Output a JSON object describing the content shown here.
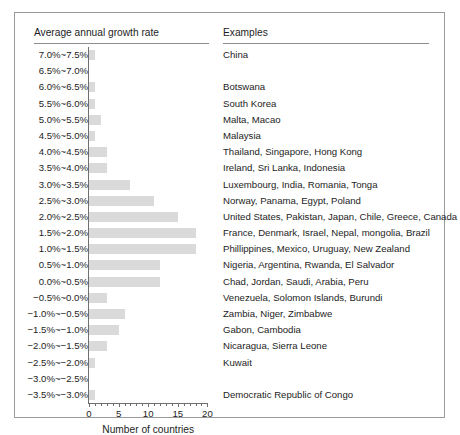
{
  "figure": {
    "left_column_header": "Average annual growth rate",
    "right_column_header": "Examples"
  },
  "chart_data": {
    "type": "bar",
    "orientation": "horizontal",
    "title": "",
    "xlabel": "Number of countries",
    "ylabel": "Average annual growth rate",
    "xlim": [
      0,
      20
    ],
    "xticks": [
      0,
      5,
      10,
      15,
      20
    ],
    "xtick_labels": [
      "0",
      "5",
      "10",
      "15",
      "20"
    ],
    "minor_xticks": [
      1,
      2,
      3,
      4,
      6,
      7,
      8,
      9,
      11,
      12,
      13,
      14,
      16,
      17,
      18,
      19
    ],
    "grid": false,
    "legend": null,
    "bar_color": "#dadada",
    "axis_color": "#6f6f6f",
    "categories": [
      "7.0%~7.5%",
      "6.5%~7.0%",
      "6.0%~6.5%",
      "5.5%~6.0%",
      "5.0%~5.5%",
      "4.5%~5.0%",
      "4.0%~4.5%",
      "3.5%~4.0%",
      "3.0%~3.5%",
      "2.5%~3.0%",
      "2.0%~2.5%",
      "1.5%~2.0%",
      "1.0%~1.5%",
      "0.5%~1.0%",
      "0.0%~0.5%",
      "−0.5%~0.0%",
      "−1.0%~−0.5%",
      "−1.5%~−1.0%",
      "−2.0%~−1.5%",
      "−2.5%~−2.0%",
      "−3.0%~−2.5%",
      "−3.5%~−3.0%"
    ],
    "values": [
      1,
      0,
      1,
      1,
      2,
      1,
      3,
      3,
      7,
      11,
      15,
      18,
      18,
      12,
      12,
      3,
      6,
      5,
      3,
      1,
      0,
      1
    ],
    "examples": [
      "China",
      "",
      "Botswana",
      "South Korea",
      "Malta, Macao",
      "Malaysia",
      "Thailand, Singapore, Hong Kong",
      "Ireland, Sri Lanka, Indonesia",
      "Luxembourg, India, Romania, Tonga",
      "Norway, Panama, Egypt, Poland",
      "United States, Pakistan, Japan, Chile, Greece, Canada",
      "France, Denmark, Israel, Nepal, mongolia, Brazil",
      "Phillippines, Mexico, Uruguay, New Zealand",
      "Nigeria, Argentina, Rwanda, El Salvador",
      "Chad, Jordan, Saudi, Arabia, Peru",
      "Venezuela, Solomon Islands, Burundi",
      "Zambia, Niger, Zimbabwe",
      "Gabon, Cambodia",
      "Nicaragua, Sierra Leone",
      "Kuwait",
      "",
      "Democratic Republic of Congo"
    ]
  }
}
